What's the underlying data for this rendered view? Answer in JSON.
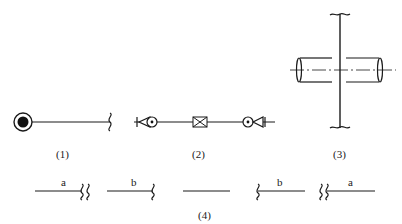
{
  "figures": [
    {
      "id": "1",
      "caption": "(1)"
    },
    {
      "id": "2",
      "caption": "(2)"
    },
    {
      "id": "3",
      "caption": "(3)"
    },
    {
      "id": "4",
      "caption": "(4)",
      "segments": [
        {
          "label": "a"
        },
        {
          "label": "b"
        },
        {
          "label": ""
        },
        {
          "label": "b"
        },
        {
          "label": "a"
        }
      ]
    }
  ]
}
